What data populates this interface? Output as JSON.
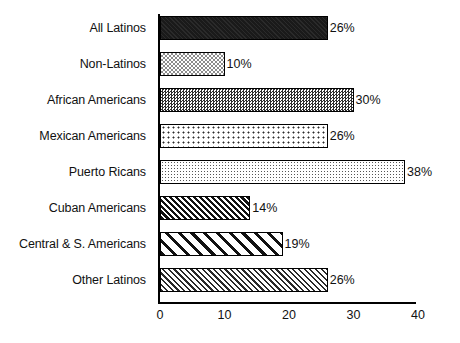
{
  "chart_data": {
    "type": "bar",
    "orientation": "horizontal",
    "title": "",
    "xlabel": "",
    "ylabel": "",
    "xlim": [
      0,
      40
    ],
    "xticks": [
      0,
      10,
      20,
      30,
      40
    ],
    "xtick_labels": [
      "0",
      "10",
      "20",
      "30",
      "40"
    ],
    "grid": false,
    "legend": "none",
    "value_label_suffix": "%",
    "categories": [
      "All Latinos",
      "Non-Latinos",
      "African Americans",
      "Mexican Americans",
      "Puerto Ricans",
      "Cuban Americans",
      "Central & S. Americans",
      "Other Latinos"
    ],
    "values": [
      26,
      10,
      30,
      26,
      38,
      14,
      19,
      26
    ],
    "value_labels": [
      "26%",
      "10%",
      "30%",
      "26%",
      "38%",
      "14%",
      "19%",
      "26%"
    ],
    "bar_patterns": [
      "solid-dark",
      "checker-medium-gray",
      "checker-dark-dense",
      "dots-light-sparse",
      "dots-fine-gray",
      "diagonal-hatch-dense-dark",
      "diagonal-hatch-wide",
      "diagonal-hatch-fine"
    ]
  },
  "footer": {
    "cut_off_text": ""
  }
}
